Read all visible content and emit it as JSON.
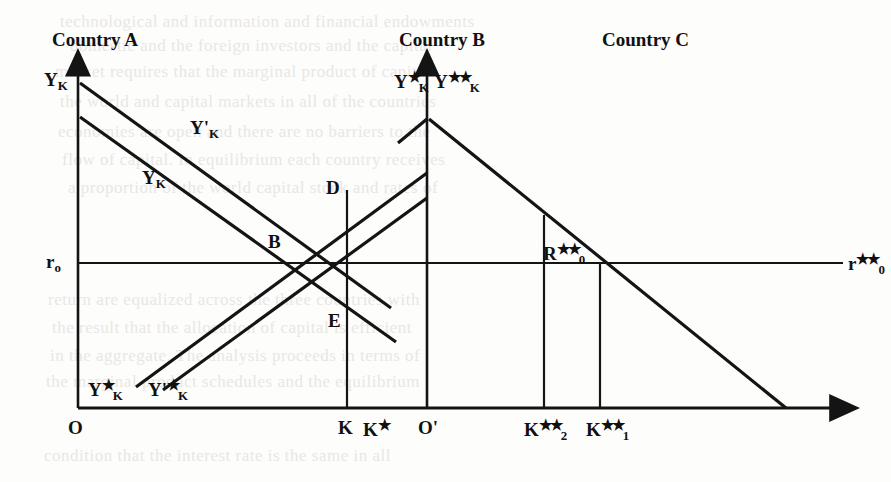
{
  "figure": {
    "type": "economics-diagram"
  },
  "headers": [
    {
      "id": "country-a",
      "label": "Country A",
      "x": 52,
      "y": 30
    },
    {
      "id": "country-b",
      "label": "Country B",
      "x": 399,
      "y": 30
    },
    {
      "id": "country-c",
      "label": "Country C",
      "x": 602,
      "y": 30
    }
  ],
  "axis_labels": [
    {
      "id": "y-k-left-axis",
      "text": "Y",
      "sub": "K",
      "sup": "",
      "x": 44,
      "y": 70
    },
    {
      "id": "y-k-star-center-axis",
      "text": "Y",
      "sub": "K",
      "sup": "★",
      "x": 394,
      "y": 70
    },
    {
      "id": "y-k-doublestar-center-axis",
      "text": "Y",
      "sub": "K",
      "sup": "★★",
      "x": 434,
      "y": 70
    },
    {
      "id": "r0-left",
      "text": "r",
      "sub": "o",
      "sup": "",
      "x": 46,
      "y": 252
    },
    {
      "id": "r0-doublestar-right",
      "text": "r",
      "sub": "0",
      "sup": "★★",
      "x": 848,
      "y": 252
    }
  ],
  "curve_labels": [
    {
      "id": "y-k-prime-curve",
      "text": "Y",
      "sub": "K",
      "sup": "",
      "prime": "'",
      "x": 190,
      "y": 118
    },
    {
      "id": "y-k-curve",
      "text": "Y",
      "sub": "K",
      "sup": "",
      "prime": "",
      "x": 142,
      "y": 168
    },
    {
      "id": "y-k-star-curve",
      "text": "Y",
      "sub": "K",
      "sup": "★",
      "prime": "",
      "x": 88,
      "y": 378
    },
    {
      "id": "y-k-star-prime-curve",
      "text": "Y",
      "sub": "K",
      "sup": "★",
      "prime": "'",
      "x": 148,
      "y": 378
    }
  ],
  "points": [
    {
      "id": "point-b",
      "label": "B",
      "x": 268,
      "y": 232
    },
    {
      "id": "point-d",
      "label": "D",
      "x": 326,
      "y": 178
    },
    {
      "id": "point-e",
      "label": "E",
      "x": 328,
      "y": 311
    },
    {
      "id": "point-r0-doublestar",
      "label": "R",
      "sub": "0",
      "sup": "★★",
      "x": 543,
      "y": 242
    }
  ],
  "baseline_ticks": [
    {
      "id": "origin-o",
      "label": "O",
      "sub": "",
      "sup": "",
      "prime": "",
      "x": 68,
      "y": 418
    },
    {
      "id": "tick-k",
      "label": "K",
      "sub": "",
      "sup": "",
      "prime": "",
      "x": 338,
      "y": 418
    },
    {
      "id": "tick-k-star",
      "label": "K",
      "sub": "",
      "sup": "★",
      "prime": "",
      "x": 363,
      "y": 418
    },
    {
      "id": "origin-o-prime",
      "label": "O",
      "sub": "",
      "sup": "",
      "prime": "'",
      "x": 418,
      "y": 418
    },
    {
      "id": "tick-k2-doublestar",
      "label": "K",
      "sub": "2",
      "sup": "★★",
      "prime": "",
      "x": 524,
      "y": 418
    },
    {
      "id": "tick-k1-doublestar",
      "label": "K",
      "sub": "1",
      "sup": "★★",
      "prime": "",
      "x": 586,
      "y": 418
    }
  ],
  "geometry": {
    "stroke_color": "#141414",
    "axis_left_x": 78,
    "axis_center_x": 427,
    "baseline_y": 408,
    "r0_line_y": 263,
    "vertical_k_x": 347,
    "vertical_k2_x": 544,
    "vertical_k1_x": 600
  },
  "background_text": [
    {
      "text": "technological and information and financial endowments",
      "x": 60,
      "y": 12
    },
    {
      "text": "domestic and the foreign investors and the capital",
      "x": 70,
      "y": 36
    },
    {
      "text": "market requires that the marginal product of capital",
      "x": 55,
      "y": 62
    },
    {
      "text": "the world and capital markets in all of the countries",
      "x": 60,
      "y": 92
    },
    {
      "text": "economies are open and there are no barriers to the",
      "x": 58,
      "y": 122
    },
    {
      "text": "flow of capital. In equilibrium each country receives",
      "x": 62,
      "y": 150
    },
    {
      "text": "a proportion of the world capital stock and rates of",
      "x": 68,
      "y": 178
    },
    {
      "text": "return are equalized across the three countries with",
      "x": 48,
      "y": 290
    },
    {
      "text": "the result that the allocation of capital is efficient",
      "x": 52,
      "y": 318
    },
    {
      "text": "in the aggregate. The analysis proceeds in terms of",
      "x": 50,
      "y": 346
    },
    {
      "text": "the marginal product schedules and the equilibrium",
      "x": 46,
      "y": 372
    },
    {
      "text": "condition that the interest rate is the same in all",
      "x": 44,
      "y": 446
    }
  ]
}
